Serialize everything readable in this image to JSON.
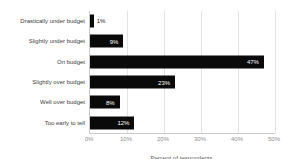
{
  "chart_data": {
    "type": "bar",
    "orientation": "horizontal",
    "categories": [
      "Drastically under budget",
      "Slightly under budget",
      "On budget",
      "Slightly over budget",
      "Well over budget",
      "Too early to tell"
    ],
    "values": [
      1,
      9,
      47,
      23,
      8,
      12
    ],
    "value_labels": [
      "1%",
      "9%",
      "47%",
      "23%",
      "8%",
      "12%"
    ],
    "xlabel": "Percent of respondents",
    "ylabel": "",
    "xlim": [
      0,
      50
    ],
    "xticks": [
      "0%",
      "10%",
      "20%",
      "30%",
      "40%",
      "50%"
    ],
    "grid": "vertical",
    "legend": "none",
    "colors": {
      "bar": "#0a0a0a",
      "value_label_inside": "#ffffff",
      "value_label_outside": "#1a1a1a",
      "gridline": "#e2e2e2",
      "tick_text": "#8c8c8c"
    }
  }
}
